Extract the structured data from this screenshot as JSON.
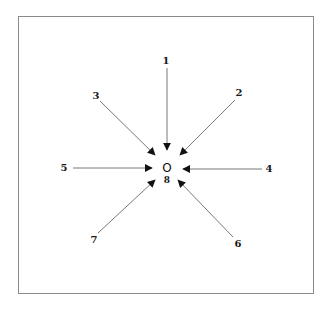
{
  "diagram": {
    "center": {
      "symbol": "O",
      "label": "8",
      "x": 167,
      "y": 168
    },
    "arrows": [
      {
        "label": "1",
        "lx": 166,
        "ly": 61,
        "x1": 167,
        "y1": 68,
        "x2": 167,
        "y2": 150
      },
      {
        "label": "2",
        "lx": 239,
        "ly": 93,
        "x1": 235,
        "y1": 100,
        "x2": 180,
        "y2": 155
      },
      {
        "label": "3",
        "lx": 96,
        "ly": 96,
        "x1": 100,
        "y1": 101,
        "x2": 155,
        "y2": 155
      },
      {
        "label": "4",
        "lx": 269,
        "ly": 169,
        "x1": 262,
        "y1": 169,
        "x2": 183,
        "y2": 169
      },
      {
        "label": "5",
        "lx": 64,
        "ly": 168,
        "x1": 73,
        "y1": 168,
        "x2": 152,
        "y2": 168
      },
      {
        "label": "6",
        "lx": 238,
        "ly": 244,
        "x1": 233,
        "y1": 237,
        "x2": 178,
        "y2": 180
      },
      {
        "label": "7",
        "lx": 94,
        "ly": 240,
        "x1": 98,
        "y1": 233,
        "x2": 155,
        "y2": 180
      }
    ],
    "colors": {
      "line": "#555555",
      "arrowhead": "#111111",
      "frame": "#8a8a8a"
    }
  }
}
